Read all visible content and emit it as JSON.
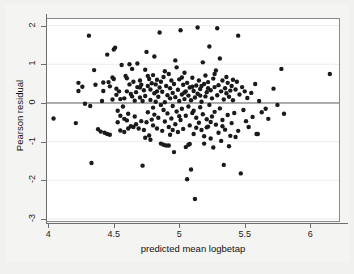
{
  "figure": {
    "background_color": "#f1f1ef",
    "plot_background_color": "#ffffff",
    "marker_color": "#1a1a1a",
    "gridline_color": "#ececec",
    "zeroline_color": "#5a5a5a"
  },
  "chart_data": {
    "type": "scatter",
    "title": "",
    "xlabel": "predicted mean logbetap",
    "ylabel": "Pearson residual",
    "xlim": [
      3.99,
      6.22
    ],
    "ylim": [
      -3.05,
      2.17
    ],
    "xticks": [
      4,
      4.5,
      5,
      5.5,
      6
    ],
    "xtick_labels": [
      "4",
      "4.5",
      "5",
      "5.5",
      "6"
    ],
    "yticks": [
      2,
      1,
      0,
      -1,
      -2,
      -3
    ],
    "ytick_labels": [
      "2",
      "1",
      "0",
      "-1",
      "-2",
      "-3"
    ],
    "grid": true,
    "grid_axis": "y",
    "legend": null,
    "reference_lines": [
      {
        "type": "horizontal",
        "value": 0,
        "color": "#5a5a5a"
      }
    ],
    "marker": {
      "shape": "circle",
      "filled": true,
      "size_px": 3.6
    },
    "n_points": 268,
    "points": [
      [
        4.04,
        -0.4
      ],
      [
        4.21,
        -0.52
      ],
      [
        4.23,
        0.52
      ],
      [
        4.23,
        0.31
      ],
      [
        4.26,
        0.42
      ],
      [
        4.28,
        -0.02
      ],
      [
        4.31,
        1.74
      ],
      [
        4.32,
        -0.08
      ],
      [
        4.33,
        -1.55
      ],
      [
        4.35,
        0.85
      ],
      [
        4.36,
        0.47
      ],
      [
        4.38,
        -0.68
      ],
      [
        4.4,
        -0.74
      ],
      [
        4.41,
        0.05
      ],
      [
        4.42,
        0.53
      ],
      [
        4.42,
        0.31
      ],
      [
        4.43,
        -0.77
      ],
      [
        4.45,
        1.25
      ],
      [
        4.45,
        -0.8
      ],
      [
        4.46,
        0.54
      ],
      [
        4.47,
        0.43
      ],
      [
        4.47,
        -0.82
      ],
      [
        4.49,
        0.09
      ],
      [
        4.5,
        0.62
      ],
      [
        4.5,
        1.38
      ],
      [
        4.51,
        1.43
      ],
      [
        4.52,
        0.37
      ],
      [
        4.52,
        0.21
      ],
      [
        4.53,
        -0.2
      ],
      [
        4.54,
        0.3
      ],
      [
        4.55,
        0.1
      ],
      [
        4.55,
        -0.33
      ],
      [
        4.56,
        0.98
      ],
      [
        4.57,
        -0.09
      ],
      [
        4.58,
        0.12
      ],
      [
        4.58,
        -0.41
      ],
      [
        4.59,
        0.7
      ],
      [
        4.6,
        0.64
      ],
      [
        4.6,
        0.3
      ],
      [
        4.61,
        -0.28
      ],
      [
        4.62,
        1.0
      ],
      [
        4.62,
        0.48
      ],
      [
        4.63,
        0.23
      ],
      [
        4.63,
        -0.6
      ],
      [
        4.64,
        0.17
      ],
      [
        4.65,
        -0.62
      ],
      [
        4.65,
        0.55
      ],
      [
        4.66,
        -0.35
      ],
      [
        4.67,
        0.28
      ],
      [
        4.67,
        -0.55
      ],
      [
        4.68,
        1.02
      ],
      [
        4.68,
        0.41
      ],
      [
        4.69,
        -0.66
      ],
      [
        4.7,
        0.14
      ],
      [
        4.7,
        0.58
      ],
      [
        4.71,
        -0.47
      ],
      [
        4.72,
        0.05
      ],
      [
        4.72,
        -1.62
      ],
      [
        4.73,
        0.33
      ],
      [
        4.73,
        -0.7
      ],
      [
        4.74,
        0.86
      ],
      [
        4.74,
        0.18
      ],
      [
        4.75,
        -0.5
      ],
      [
        4.75,
        1.32
      ],
      [
        4.76,
        0.44
      ],
      [
        4.76,
        -0.24
      ],
      [
        4.77,
        0.62
      ],
      [
        4.77,
        -0.84
      ],
      [
        4.78,
        0.08
      ],
      [
        4.78,
        0.35
      ],
      [
        4.79,
        -0.43
      ],
      [
        4.79,
        0.51
      ],
      [
        4.8,
        -0.12
      ],
      [
        4.8,
        0.72
      ],
      [
        4.8,
        -0.58
      ],
      [
        4.81,
        0.25
      ],
      [
        4.81,
        -0.3
      ],
      [
        4.82,
        0.48
      ],
      [
        4.82,
        0.03
      ],
      [
        4.83,
        -0.66
      ],
      [
        4.83,
        0.6
      ],
      [
        4.84,
        0.16
      ],
      [
        4.84,
        -0.38
      ],
      [
        4.85,
        1.82
      ],
      [
        4.85,
        0.4
      ],
      [
        4.86,
        -0.05
      ],
      [
        4.86,
        0.55
      ],
      [
        4.87,
        -0.72
      ],
      [
        4.87,
        0.29
      ],
      [
        4.88,
        -0.18
      ],
      [
        4.88,
        0.67
      ],
      [
        4.89,
        0.02
      ],
      [
        4.89,
        -0.48
      ],
      [
        4.9,
        0.44
      ],
      [
        4.9,
        -1.1
      ],
      [
        4.91,
        0.2
      ],
      [
        4.91,
        -0.27
      ],
      [
        4.92,
        0.75
      ],
      [
        4.92,
        -0.62
      ],
      [
        4.93,
        0.12
      ],
      [
        4.93,
        0.38
      ],
      [
        4.94,
        -0.4
      ],
      [
        4.94,
        0.58
      ],
      [
        4.95,
        -0.08
      ],
      [
        4.95,
        0.26
      ],
      [
        4.96,
        -1.27
      ],
      [
        4.96,
        0.49
      ],
      [
        4.97,
        -0.55
      ],
      [
        4.97,
        0.15
      ],
      [
        4.98,
        0.92
      ],
      [
        4.98,
        -0.22
      ],
      [
        4.99,
        0.34
      ],
      [
        4.99,
        -0.75
      ],
      [
        5.0,
        0.05
      ],
      [
        5.0,
        0.61
      ],
      [
        5.01,
        -0.44
      ],
      [
        5.01,
        1.88
      ],
      [
        5.02,
        0.22
      ],
      [
        5.02,
        -0.15
      ],
      [
        5.03,
        0.47
      ],
      [
        5.03,
        -0.67
      ],
      [
        5.04,
        0.1
      ],
      [
        5.04,
        0.78
      ],
      [
        5.05,
        -0.33
      ],
      [
        5.05,
        0.3
      ],
      [
        5.06,
        -1.97
      ],
      [
        5.06,
        0.52
      ],
      [
        5.07,
        -0.09
      ],
      [
        5.07,
        0.19
      ],
      [
        5.08,
        -0.58
      ],
      [
        5.08,
        0.4
      ],
      [
        5.09,
        -1.72
      ],
      [
        5.09,
        0.07
      ],
      [
        5.1,
        0.65
      ],
      [
        5.1,
        -0.26
      ],
      [
        5.11,
        0.31
      ],
      [
        5.11,
        -0.8
      ],
      [
        5.12,
        0.14
      ],
      [
        5.12,
        -2.48
      ],
      [
        5.13,
        0.45
      ],
      [
        5.13,
        -0.38
      ],
      [
        5.14,
        1.95
      ],
      [
        5.14,
        0.24
      ],
      [
        5.15,
        -0.51
      ],
      [
        5.15,
        0.58
      ],
      [
        5.16,
        -0.11
      ],
      [
        5.16,
        0.36
      ],
      [
        5.17,
        -0.7
      ],
      [
        5.17,
        0.03
      ],
      [
        5.18,
        1.05
      ],
      [
        5.18,
        -0.29
      ],
      [
        5.19,
        0.49
      ],
      [
        5.19,
        -0.86
      ],
      [
        5.2,
        0.17
      ],
      [
        5.2,
        0.71
      ],
      [
        5.21,
        -0.42
      ],
      [
        5.21,
        0.28
      ],
      [
        5.22,
        -0.61
      ],
      [
        5.22,
        0.54
      ],
      [
        5.23,
        -0.05
      ],
      [
        5.23,
        1.46
      ],
      [
        5.24,
        0.33
      ],
      [
        5.24,
        -0.92
      ],
      [
        5.25,
        0.12
      ],
      [
        5.25,
        -0.35
      ],
      [
        5.26,
        0.63
      ],
      [
        5.26,
        -1.15
      ],
      [
        5.27,
        0.41
      ],
      [
        5.27,
        -0.23
      ],
      [
        5.28,
        0.84
      ],
      [
        5.28,
        -0.56
      ],
      [
        5.29,
        0.2
      ],
      [
        5.29,
        1.93
      ],
      [
        5.3,
        -0.77
      ],
      [
        5.3,
        0.46
      ],
      [
        5.31,
        -0.14
      ],
      [
        5.31,
        1.15
      ],
      [
        5.32,
        0.3
      ],
      [
        5.32,
        -0.98
      ],
      [
        5.33,
        0.58
      ],
      [
        5.33,
        -0.44
      ],
      [
        5.34,
        0.09
      ],
      [
        5.34,
        -1.6
      ],
      [
        5.35,
        0.38
      ],
      [
        5.35,
        -0.69
      ],
      [
        5.36,
        0.25
      ],
      [
        5.36,
        0.67
      ],
      [
        5.37,
        -0.31
      ],
      [
        5.37,
        0.52
      ],
      [
        5.38,
        -1.12
      ],
      [
        5.38,
        0.16
      ],
      [
        5.39,
        -0.85
      ],
      [
        5.4,
        0.44
      ],
      [
        5.4,
        -0.52
      ],
      [
        5.41,
        0.6
      ],
      [
        5.41,
        0.07
      ],
      [
        5.42,
        -0.26
      ],
      [
        5.43,
        0.35
      ],
      [
        5.43,
        -0.88
      ],
      [
        5.44,
        0.55
      ],
      [
        5.45,
        -0.72
      ],
      [
        5.45,
        1.74
      ],
      [
        5.46,
        0.22
      ],
      [
        5.47,
        -1.82
      ],
      [
        5.48,
        0.41
      ],
      [
        5.49,
        -0.18
      ],
      [
        5.5,
        0.3
      ],
      [
        5.51,
        -0.47
      ],
      [
        5.52,
        0.13
      ],
      [
        5.53,
        -0.62
      ],
      [
        5.55,
        0.26
      ],
      [
        5.56,
        -0.36
      ],
      [
        5.58,
        0.49
      ],
      [
        5.59,
        -0.8
      ],
      [
        5.6,
        -0.8
      ],
      [
        5.61,
        0.05
      ],
      [
        5.63,
        -0.24
      ],
      [
        5.66,
        -0.15
      ],
      [
        5.68,
        -0.41
      ],
      [
        5.72,
        0.37
      ],
      [
        5.75,
        -0.05
      ],
      [
        5.78,
        0.88
      ],
      [
        5.8,
        -0.28
      ],
      [
        6.15,
        0.75
      ],
      [
        4.49,
        0.66
      ],
      [
        4.53,
        -0.5
      ],
      [
        4.6,
        -0.45
      ],
      [
        4.64,
        0.88
      ],
      [
        4.71,
        0.47
      ],
      [
        4.74,
        -0.9
      ],
      [
        4.78,
        -0.95
      ],
      [
        4.81,
        1.2
      ],
      [
        4.86,
        -1.05
      ],
      [
        4.89,
        0.82
      ],
      [
        4.93,
        -0.82
      ],
      [
        4.97,
        1.1
      ],
      [
        5.0,
        -0.34
      ],
      [
        5.04,
        0.27
      ],
      [
        5.07,
        -1.08
      ],
      [
        5.1,
        0.42
      ],
      [
        5.13,
        -0.64
      ],
      [
        5.16,
        0.19
      ],
      [
        5.19,
        -1.05
      ],
      [
        5.22,
        0.38
      ],
      [
        5.05,
        -1.14
      ],
      [
        5.08,
        -1.06
      ],
      [
        4.92,
        -1.1
      ],
      [
        4.88,
        -1.08
      ],
      [
        4.66,
        0.06
      ],
      [
        4.7,
        0.4
      ],
      [
        4.83,
        0.3
      ],
      [
        4.95,
        -0.7
      ],
      [
        5.02,
        0.66
      ],
      [
        5.11,
        -0.2
      ],
      [
        5.17,
        0.44
      ],
      [
        5.24,
        -0.49
      ],
      [
        4.55,
        -0.71
      ],
      [
        4.58,
        -0.75
      ],
      [
        4.61,
        -0.66
      ],
      [
        4.76,
        0.7
      ],
      [
        5.21,
        -0.63
      ],
      [
        5.27,
        0.75
      ],
      [
        5.33,
        -0.6
      ],
      [
        5.39,
        0.32
      ]
    ]
  }
}
